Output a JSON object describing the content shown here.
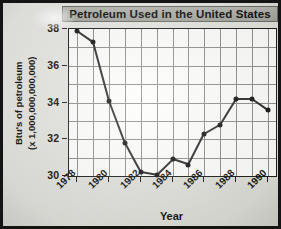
{
  "chart_data": {
    "type": "line",
    "title": "Petroleum Used in the United States",
    "xlabel": "Year",
    "ylabel": "Btu's of petroleum (x 1,000,000,000,000)",
    "ylabel_line1": "Btu's of petroleum",
    "ylabel_line2": "(x 1,000,000,000,000)",
    "x": [
      1978,
      1979,
      1980,
      1981,
      1982,
      1983,
      1984,
      1985,
      1986,
      1987,
      1988,
      1989,
      1990
    ],
    "values": [
      37.9,
      37.3,
      34.1,
      31.8,
      30.2,
      30.05,
      30.9,
      30.6,
      32.3,
      32.8,
      34.2,
      34.2,
      33.6
    ],
    "xlim": [
      1977.5,
      1990.5
    ],
    "ylim": [
      30,
      38
    ],
    "yticks": [
      30,
      32,
      34,
      36,
      38
    ],
    "ytick_labels": [
      "30",
      "32",
      "34",
      "36",
      "38"
    ],
    "xticks": [
      1978,
      1980,
      1982,
      1984,
      1986,
      1988,
      1990
    ],
    "xtick_labels": [
      "1978",
      "1980",
      "1982",
      "1984",
      "1986",
      "1988",
      "1990"
    ],
    "grid": true,
    "legend": "none",
    "marker": "filled-circle",
    "line_color": "#2a2a2a",
    "marker_color": "#151515",
    "grid_color": "#8e8e8a",
    "plot_background": "#fdfdfc",
    "page_background": "#e3e3de",
    "title_band_color": "#aeaea8"
  }
}
